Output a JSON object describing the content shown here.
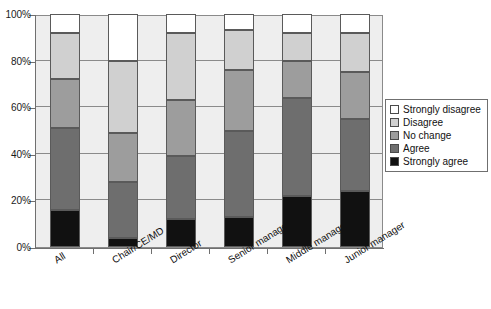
{
  "title": {
    "text": "",
    "clipped": true
  },
  "chart_data": {
    "type": "bar",
    "variant": "stacked-100-percent",
    "title": "",
    "xlabel": "",
    "ylabel": "",
    "ylim": [
      0,
      100
    ],
    "ytick_labels": [
      "0%",
      "20%",
      "40%",
      "60%",
      "80%",
      "100%"
    ],
    "ytick_values": [
      0,
      20,
      40,
      60,
      80,
      100
    ],
    "grid": true,
    "grid_axis": "y",
    "legend_position": "right",
    "categories": [
      "All",
      "Chair/CE/MD",
      "Director",
      "Senior manager",
      "Middle manager",
      "Junior manager"
    ],
    "series": [
      {
        "name": "Strongly agree",
        "color": "#111111",
        "values": [
          16,
          4,
          12,
          13,
          22,
          24
        ]
      },
      {
        "name": "Agree",
        "color": "#6e6e6e",
        "values": [
          35,
          24,
          27,
          37,
          42,
          31
        ]
      },
      {
        "name": "No change",
        "color": "#9d9d9d",
        "values": [
          21,
          21,
          24,
          26,
          16,
          20
        ]
      },
      {
        "name": "Disagree",
        "color": "#d0d0d0",
        "values": [
          20,
          31,
          29,
          17,
          12,
          17
        ]
      },
      {
        "name": "Strongly disagree",
        "color": "#ffffff",
        "values": [
          8,
          20,
          8,
          7,
          8,
          8
        ]
      }
    ],
    "cumulative_tops": {
      "All": [
        16,
        51,
        72,
        92,
        100
      ],
      "Chair/CE/MD": [
        4,
        28,
        49,
        80,
        100
      ],
      "Director": [
        12,
        39,
        63,
        92,
        100
      ],
      "Senior manager": [
        13,
        50,
        76,
        93,
        100
      ],
      "Middle manager": [
        22,
        64,
        80,
        92,
        100
      ],
      "Junior manager": [
        24,
        55,
        75,
        92,
        100
      ]
    }
  },
  "legend": {
    "entries": [
      {
        "label": "Strongly disagree",
        "color": "#ffffff"
      },
      {
        "label": "Disagree",
        "color": "#d0d0d0"
      },
      {
        "label": "No change",
        "color": "#9d9d9d"
      },
      {
        "label": "Agree",
        "color": "#6e6e6e"
      },
      {
        "label": "Strongly agree",
        "color": "#111111"
      }
    ]
  },
  "colors": {
    "plot_background": "#eeeeee",
    "gridline": "#8a8a8a",
    "axis": "#6f6f6f",
    "page_background": "#ffffff"
  }
}
